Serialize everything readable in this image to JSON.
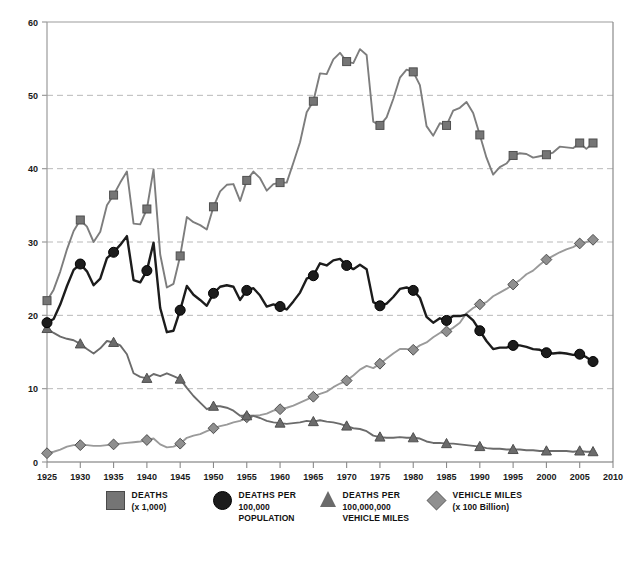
{
  "chart_data": {
    "type": "line",
    "title": "",
    "xlabel": "",
    "ylabel": "",
    "xlim": [
      1925,
      2010
    ],
    "ylim": [
      0,
      60
    ],
    "xticks": [
      "1925",
      "1930",
      "1935",
      "1940",
      "1945",
      "1950",
      "1955",
      "1960",
      "1965",
      "1970",
      "1975",
      "1980",
      "1985",
      "1990",
      "1995",
      "2000",
      "2005",
      "2010"
    ],
    "yticks": [
      "0",
      "10",
      "20",
      "30",
      "40",
      "50",
      "60"
    ],
    "grid": "horizontal-dashed",
    "legend_position": "bottom",
    "x": [
      1925,
      1926,
      1927,
      1928,
      1929,
      1930,
      1931,
      1932,
      1933,
      1934,
      1935,
      1936,
      1937,
      1938,
      1939,
      1940,
      1941,
      1942,
      1943,
      1944,
      1945,
      1946,
      1947,
      1948,
      1949,
      1950,
      1951,
      1952,
      1953,
      1954,
      1955,
      1956,
      1957,
      1958,
      1959,
      1960,
      1961,
      1962,
      1963,
      1964,
      1965,
      1966,
      1967,
      1968,
      1969,
      1970,
      1971,
      1972,
      1973,
      1974,
      1975,
      1976,
      1977,
      1978,
      1979,
      1980,
      1981,
      1982,
      1983,
      1984,
      1985,
      1986,
      1987,
      1988,
      1989,
      1990,
      1991,
      1992,
      1993,
      1994,
      1995,
      1996,
      1997,
      1998,
      1999,
      2000,
      2001,
      2002,
      2003,
      2004,
      2005,
      2006,
      2007
    ],
    "series": [
      {
        "name": "DEATHS (x 1,000)",
        "marker": "square",
        "color": "#7d7d7d",
        "marker_color": "#757575",
        "values": [
          22.0,
          23.5,
          26.0,
          29.0,
          31.5,
          33.0,
          32.1,
          30.0,
          31.4,
          35.0,
          36.4,
          38.1,
          39.6,
          32.5,
          32.4,
          34.5,
          39.9,
          28.3,
          23.8,
          24.3,
          28.1,
          33.4,
          32.7,
          32.3,
          31.7,
          34.8,
          36.9,
          37.8,
          37.9,
          35.6,
          38.4,
          39.6,
          38.7,
          37.0,
          37.9,
          38.1,
          38.1,
          40.8,
          43.6,
          47.7,
          49.2,
          53.0,
          52.9,
          54.9,
          55.8,
          54.6,
          54.4,
          56.3,
          55.5,
          46.4,
          45.9,
          47.0,
          49.5,
          52.4,
          53.5,
          53.2,
          51.4,
          45.8,
          44.5,
          46.2,
          45.9,
          47.9,
          48.3,
          49.1,
          47.6,
          44.6,
          41.5,
          39.2,
          40.2,
          40.7,
          41.8,
          42.1,
          42.0,
          41.5,
          41.7,
          41.9,
          42.2,
          43.0,
          42.9,
          42.8,
          43.5,
          42.7,
          43.5
        ]
      },
      {
        "name": "DEATHS PER 100,000 POPULATION",
        "marker": "circle",
        "color": "#1c1c1c",
        "marker_color": "#1c1c1c",
        "values": [
          19.0,
          19.5,
          21.5,
          24.0,
          26.2,
          27.0,
          26.0,
          24.1,
          25.0,
          27.8,
          28.6,
          29.6,
          30.8,
          24.8,
          24.5,
          26.1,
          29.9,
          21.0,
          17.7,
          17.9,
          20.7,
          24.0,
          22.8,
          22.1,
          21.3,
          23.0,
          23.9,
          24.1,
          23.9,
          22.1,
          23.4,
          23.7,
          22.7,
          21.2,
          21.5,
          21.2,
          20.8,
          21.9,
          23.1,
          25.0,
          25.4,
          27.1,
          26.8,
          27.5,
          27.7,
          26.8,
          26.3,
          26.9,
          26.3,
          21.8,
          21.3,
          21.6,
          22.5,
          23.6,
          23.8,
          23.4,
          22.4,
          19.8,
          19.0,
          19.6,
          19.3,
          19.9,
          19.9,
          20.1,
          19.3,
          17.9,
          16.5,
          15.4,
          15.6,
          15.6,
          15.9,
          15.9,
          15.7,
          15.4,
          15.3,
          14.9,
          14.8,
          14.9,
          14.8,
          14.6,
          14.7,
          14.3,
          13.7
        ]
      },
      {
        "name": "DEATHS PER 100,000,000 VEHICLE MILES",
        "marker": "triangle",
        "color": "#6b6b6b",
        "marker_color": "#6b6b6b",
        "values": [
          18.2,
          17.6,
          17.1,
          16.8,
          16.6,
          16.1,
          15.4,
          14.8,
          15.5,
          16.5,
          16.3,
          15.9,
          14.7,
          12.1,
          11.6,
          11.4,
          12.0,
          11.7,
          12.1,
          11.7,
          11.3,
          10.1,
          9.0,
          8.1,
          7.2,
          7.6,
          7.6,
          7.4,
          7.0,
          6.3,
          6.3,
          6.3,
          6.0,
          5.6,
          5.4,
          5.3,
          5.2,
          5.3,
          5.4,
          5.6,
          5.5,
          5.7,
          5.5,
          5.4,
          5.2,
          4.9,
          4.6,
          4.5,
          4.2,
          3.6,
          3.4,
          3.3,
          3.3,
          3.4,
          3.3,
          3.3,
          3.2,
          2.8,
          2.6,
          2.6,
          2.5,
          2.5,
          2.4,
          2.3,
          2.2,
          2.1,
          1.9,
          1.8,
          1.8,
          1.7,
          1.7,
          1.7,
          1.6,
          1.6,
          1.5,
          1.5,
          1.5,
          1.5,
          1.5,
          1.4,
          1.5,
          1.4,
          1.4
        ]
      },
      {
        "name": "VEHICLE MILES (x 100 Billion)",
        "marker": "diamond",
        "color": "#9a9a9a",
        "marker_color": "#8f8f8f",
        "values": [
          1.2,
          1.4,
          1.7,
          2.1,
          2.3,
          2.3,
          2.3,
          2.2,
          2.2,
          2.3,
          2.4,
          2.5,
          2.6,
          2.7,
          2.8,
          3.0,
          3.2,
          2.4,
          2.0,
          2.1,
          2.5,
          3.3,
          3.6,
          3.8,
          4.2,
          4.6,
          4.9,
          5.1,
          5.4,
          5.6,
          6.1,
          6.3,
          6.4,
          6.6,
          7.0,
          7.2,
          7.4,
          7.7,
          8.1,
          8.5,
          8.9,
          9.3,
          9.6,
          10.2,
          10.7,
          11.1,
          11.8,
          12.6,
          13.1,
          12.8,
          13.4,
          14.1,
          14.8,
          15.4,
          15.4,
          15.3,
          15.9,
          16.3,
          17.0,
          17.6,
          17.8,
          18.3,
          19.0,
          20.3,
          21.0,
          21.5,
          21.8,
          22.6,
          23.1,
          23.6,
          24.2,
          24.8,
          25.6,
          26.1,
          26.9,
          27.6,
          28.1,
          28.6,
          29.0,
          29.3,
          29.8,
          30.0,
          30.3
        ]
      }
    ]
  },
  "axis": {
    "y_labels": [
      "60",
      "50",
      "40",
      "30",
      "20",
      "10",
      "0"
    ],
    "x_labels": [
      "1925",
      "1930",
      "1935",
      "1940",
      "1945",
      "1950",
      "1955",
      "1960",
      "1965",
      "1970",
      "1975",
      "1980",
      "1985",
      "1990",
      "1995",
      "2000",
      "2005",
      "2010"
    ]
  },
  "legend": {
    "items": [
      {
        "swatch": "square-swatch",
        "line1": "DEATHS",
        "line2": "(x 1,000)",
        "line3": ""
      },
      {
        "swatch": "circle-swatch",
        "line1": "DEATHS PER",
        "line2": "100,000",
        "line3": "POPULATION"
      },
      {
        "swatch": "triangle-swatch",
        "line1": "DEATHS PER",
        "line2": "100,000,000",
        "line3": "VEHICLE MILES"
      },
      {
        "swatch": "diamond-swatch",
        "line1": "VEHICLE MILES",
        "line2": "(x 100 Billion)",
        "line3": ""
      }
    ]
  },
  "colors": {
    "deaths": "#7d7d7d",
    "deaths_per_pop": "#1c1c1c",
    "deaths_per_miles": "#6b6b6b",
    "vehicle_miles": "#9a9a9a",
    "axis": "#9b9b9b",
    "grid": "#b9b9b9",
    "text": "#1a1a1a"
  }
}
